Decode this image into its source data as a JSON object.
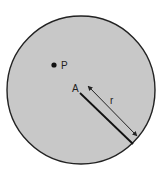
{
  "diagram": {
    "shape": "circle",
    "fill_color": "#c8c8c8",
    "stroke_color": "#222222",
    "labels": {
      "point": "P",
      "center": "A",
      "radius": "r"
    }
  }
}
